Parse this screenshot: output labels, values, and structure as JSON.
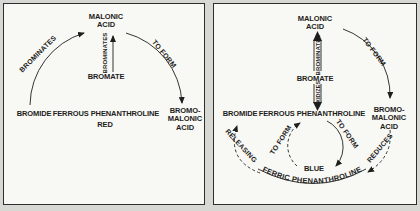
{
  "colors": {
    "page_bg": "#d7d7d4",
    "panel_bg": "#f8f8f5",
    "ink": "#1e1e1c"
  },
  "left_panel": {
    "malonic_acid": "MALONIC\nACID",
    "bromate": "BROMATE",
    "bromide": "BROMIDE",
    "ferrous": "FERROUS PHENANTHROLINE",
    "ferrous_state": "RED",
    "bromomalonic": "BROMO-\nMALONIC\nACID",
    "arc_brominates": "BROMINATES",
    "vert_brominates": "BROMINATES",
    "arc_to_form": "TO FORM"
  },
  "right_panel": {
    "malonic_acid": "MALONIC\nACID",
    "bromate": "BROMATE",
    "bromide": "BROMIDE",
    "ferrous": "FERROUS PHENANTHROLINE",
    "bromomalonic": "BROMO-\nMALONIC\nACID",
    "vert_brominates": "BROMINATES",
    "vert_oxidizes": "OXIDIZES",
    "arc_to_form": "TO FORM",
    "reduces": "REDUCES",
    "releasing": "RELEASING",
    "inner_to_form_left": "TO FORM",
    "inner_to_form_right": "TO FORM",
    "ferric_state": "BLUE",
    "ferric": "FERRIC PHENANTHROLINE"
  }
}
